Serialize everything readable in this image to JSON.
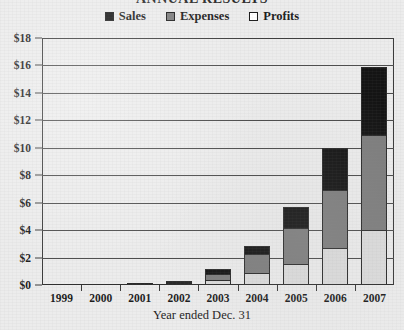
{
  "chart_data": {
    "type": "bar",
    "stacked": true,
    "title": "ANNUAL RESULTS",
    "title_clipped": true,
    "xlabel": "Year ended Dec. 31",
    "ylabel": "",
    "categories": [
      "1999",
      "2000",
      "2001",
      "2002",
      "2003",
      "2004",
      "2005",
      "2006",
      "2007"
    ],
    "series": [
      {
        "name": "Profits",
        "color": "#dcdcdc",
        "values": [
          0.0,
          0.02,
          0.05,
          0.12,
          0.35,
          0.9,
          1.5,
          2.7,
          4.0
        ]
      },
      {
        "name": "Expenses",
        "color": "#7d7d7d",
        "values": [
          0.0,
          0.03,
          0.06,
          0.18,
          0.55,
          1.4,
          2.7,
          4.3,
          7.0
        ]
      },
      {
        "name": "Sales",
        "color": "#141414",
        "values": [
          0.0,
          0.02,
          0.05,
          0.1,
          0.4,
          0.7,
          1.6,
          3.1,
          5.0
        ]
      }
    ],
    "stack_order_bottom_to_top": [
      "Profits",
      "Expenses",
      "Sales"
    ],
    "totals": [
      0.0,
      0.07,
      0.16,
      0.4,
      1.3,
      3.0,
      5.8,
      10.1,
      16.0
    ],
    "ylim": [
      0,
      18
    ],
    "ytick_values": [
      0,
      2,
      4,
      6,
      8,
      10,
      12,
      14,
      16,
      18
    ],
    "ytick_labels": [
      "$0",
      "$2",
      "$4",
      "$6",
      "$8",
      "$10",
      "$12",
      "$14",
      "$16",
      "$18"
    ],
    "grid": true,
    "grid_axis": "y",
    "legend_position": "top-center",
    "legend_entries": [
      {
        "label": "Sales",
        "swatch": "#141414"
      },
      {
        "label": "Expenses",
        "swatch": "#7d7d7d"
      },
      {
        "label": "Profits",
        "swatch": "#ffffff"
      }
    ]
  },
  "palette": {
    "background": "#ececec",
    "axis": "#3a3a3a",
    "grid": "#4a4a4a",
    "text": "#1c1c1c"
  }
}
